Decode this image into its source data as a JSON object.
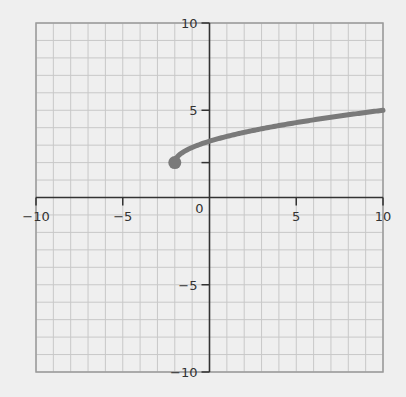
{
  "chart_data": {
    "type": "line",
    "title": "",
    "xlabel": "",
    "ylabel": "",
    "xlim": [
      -10,
      10
    ],
    "ylim": [
      -10,
      10
    ],
    "grid": true,
    "grid_minor_step": 1,
    "x_ticks": [
      -10,
      -5,
      5,
      10
    ],
    "y_ticks": [
      10,
      5,
      -5,
      -10
    ],
    "x_tick_labels": [
      "−10",
      "−5",
      "5",
      "10"
    ],
    "y_tick_labels": [
      "10",
      "5",
      "−5",
      "−10"
    ],
    "origin_label": "0",
    "series": [
      {
        "name": "f(x)",
        "function": "y = (sqrt(3)/2)*sqrt(x+2) + 2",
        "domain": [
          -2,
          10
        ],
        "start_point": {
          "x": -2,
          "y": 2,
          "marker": "filled-circle"
        },
        "end_point": {
          "x": 10,
          "y": 5
        },
        "sample_points": [
          {
            "x": -2,
            "y": 2.0
          },
          {
            "x": 0,
            "y": 3.22
          },
          {
            "x": 2,
            "y": 3.73
          },
          {
            "x": 4,
            "y": 4.12
          },
          {
            "x": 6,
            "y": 4.45
          },
          {
            "x": 8,
            "y": 4.74
          },
          {
            "x": 10,
            "y": 5.0
          }
        ],
        "color": "#7a7a7a"
      }
    ]
  },
  "colors": {
    "background": "#efefef",
    "grid_minor": "#c8c8c8",
    "grid_border": "#9a9a9a",
    "axis": "#333333",
    "curve": "#7a7a7a"
  }
}
